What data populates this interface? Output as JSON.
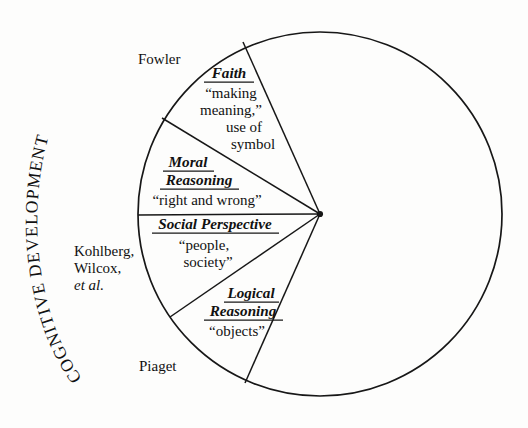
{
  "figure": {
    "outer_label": "COGNITIVE DEVELOPMENT",
    "background_color": "#fdfdfc",
    "line_color": "#171717",
    "text_color": "#111111"
  },
  "circle": {
    "center_x": 320,
    "center_y": 214,
    "radius": 182
  },
  "wedges": [
    {
      "title": "Faith",
      "lines": [
        "“making",
        "meaning,”",
        "use of",
        "symbol"
      ],
      "theorist": "Fowler"
    },
    {
      "title_lines": [
        "Moral",
        "Reasoning"
      ],
      "lines": [
        "“right and wrong”"
      ]
    },
    {
      "title": "Social Perspective",
      "lines": [
        "“people,",
        "society”"
      ]
    },
    {
      "title_lines": [
        "Logical",
        "Reasoning"
      ],
      "lines": [
        "“objects”"
      ],
      "theorist": "Piaget"
    }
  ],
  "theorists": {
    "top": "Fowler",
    "middle_line1": "Kohlberg,",
    "middle_line2": "Wilcox,",
    "middle_line3": "et al.",
    "bottom": "Piaget"
  },
  "wedge_text": {
    "faith_title": "Faith",
    "faith_l1": "“making",
    "faith_l2": "meaning,”",
    "faith_l3": "use of",
    "faith_l4": "symbol",
    "moral_title1": "Moral",
    "moral_title2": "Reasoning",
    "moral_l1": "“right and wrong”",
    "social_title": "Social Perspective",
    "social_l1": "“people,",
    "social_l2": "society”",
    "logical_title1": "Logical",
    "logical_title2": "Reasoning",
    "logical_l1": "“objects”"
  },
  "chart_data": {
    "type": "pie",
    "title": "COGNITIVE DEVELOPMENT",
    "categories": [
      "Faith",
      "Moral Reasoning",
      "Social Perspective",
      "Logical Reasoning",
      "unlabeled remainder"
    ],
    "values": [
      25,
      15,
      16,
      21,
      283
    ],
    "value_unit": "degrees of arc",
    "annotations": [
      "Fowler",
      "Kohlberg, Wilcox, et al.",
      "Piaget"
    ]
  }
}
